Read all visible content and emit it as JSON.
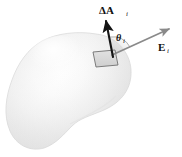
{
  "figure": {
    "kind": "physics-diagram",
    "background_color": "#ffffff",
    "labels": {
      "area_vector": {
        "symbol": "ΔA",
        "subscript": "i",
        "name": "delta-A-i"
      },
      "field_vector": {
        "symbol": "E",
        "subscript": "i",
        "name": "E-i"
      },
      "angle": {
        "symbol": "θ",
        "subscript": "i",
        "name": "theta-i"
      }
    },
    "surface": {
      "name": "gaussian-surface-blob",
      "fill_light": "#ffffff",
      "fill_mid": "#f0f0f0",
      "fill_dark": "#d8d8d8",
      "edge_color": "#cfcfcf"
    },
    "patch": {
      "name": "area-element-patch",
      "fill": "#d9d9d9",
      "stroke": "#6e6e6e"
    },
    "vectors": {
      "area_vector_color": "#151515",
      "field_vector_color": "#8a8a8a",
      "arc_color": "#9a9a9a"
    }
  }
}
